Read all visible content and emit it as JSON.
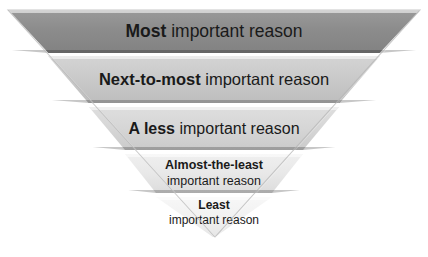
{
  "diagram": {
    "kind": "inverted-pyramid",
    "orientation": "widest-at-top",
    "background_color": "#ffffff",
    "text_color": "#1a1a1a",
    "levels": [
      {
        "rank": 1,
        "emphasis": "Most",
        "rest": " important reason",
        "full_text": "Most important reason",
        "fill_color": "#8c8c8c"
      },
      {
        "rank": 2,
        "emphasis": "Next-to-most",
        "rest": " important reason",
        "full_text": "Next-to-most important reason",
        "fill_color": "#c9c9c9"
      },
      {
        "rank": 3,
        "emphasis": "A less",
        "rest": " important reason",
        "full_text": "A less important reason",
        "fill_color": "#d6d6d6"
      },
      {
        "rank": 4,
        "emphasis": "Almost-the-least",
        "rest": "important reason",
        "full_text": "Almost-the-least important reason",
        "fill_color": "#e8e8e8"
      },
      {
        "rank": 5,
        "emphasis": "Least",
        "rest": "important reason",
        "full_text": "Least important reason",
        "fill_color": "#f1f1f1"
      }
    ]
  }
}
